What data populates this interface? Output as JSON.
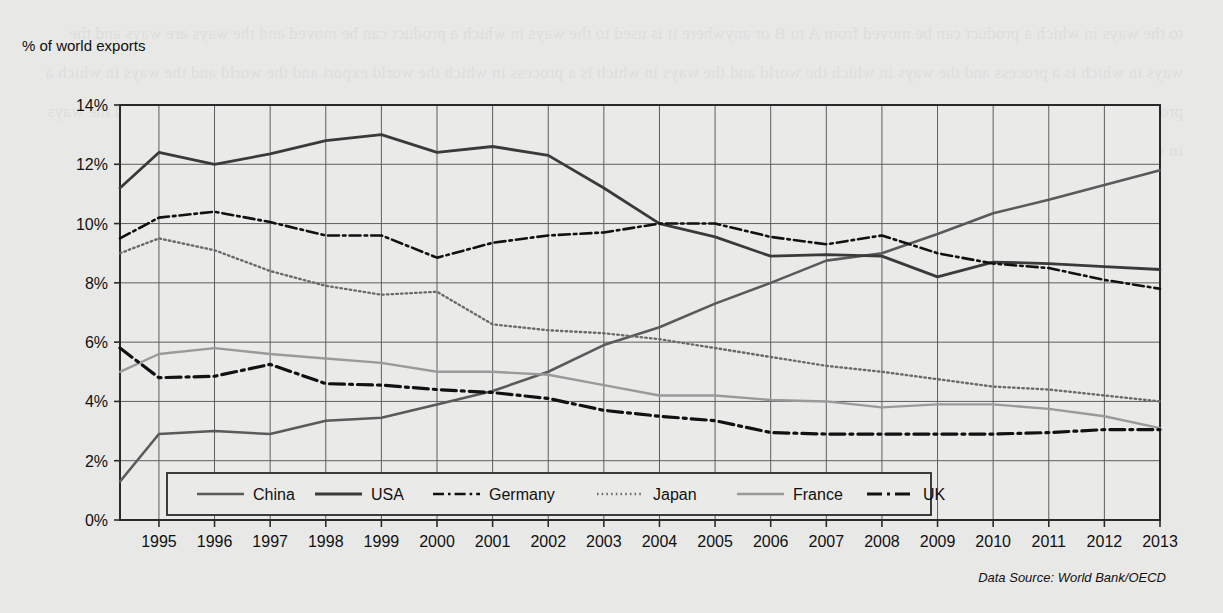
{
  "axis_title": "% of world exports",
  "source_note": "Data Source: World Bank/OECD",
  "showthrough_text": "to the ways in which a product can be moved from A to B or anywhere it is used to the ways in which a product can be moved and the ways are ways and the ways in which is a process and the ways in which the world and the ways in which is a process in which the world export and the world and the ways in which a product is and the ways and world processes and in which exports and in which the world exports and process of the world and in which a product and the ways in which the world",
  "legend": {
    "items": [
      {
        "label": "China"
      },
      {
        "label": "USA"
      },
      {
        "label": "Germany"
      },
      {
        "label": "Japan"
      },
      {
        "label": "France"
      },
      {
        "label": "UK"
      }
    ]
  },
  "chart_data": {
    "type": "line",
    "title": "",
    "xlabel": "",
    "ylabel": "% of world exports",
    "xlim": [
      1994.3,
      2013
    ],
    "ylim": [
      0,
      14
    ],
    "ytick_labels": [
      "0%",
      "2%",
      "4%",
      "6%",
      "8%",
      "10%",
      "12%",
      "14%"
    ],
    "ytick_values": [
      0,
      2,
      4,
      6,
      8,
      10,
      12,
      14
    ],
    "grid": true,
    "legend_position": "bottom-inside",
    "x": [
      1994.3,
      1995,
      1996,
      1997,
      1998,
      1999,
      2000,
      2001,
      2002,
      2003,
      2004,
      2005,
      2006,
      2007,
      2008,
      2009,
      2010,
      2011,
      2012,
      2013
    ],
    "series": [
      {
        "name": "China",
        "style": "solid",
        "color": "#5a5a5a",
        "width": 2.6,
        "values": [
          1.3,
          2.9,
          3.0,
          2.9,
          3.35,
          3.45,
          3.9,
          4.35,
          5.0,
          5.9,
          6.5,
          7.3,
          8.0,
          8.75,
          9.0,
          9.65,
          10.35,
          10.8,
          11.3,
          11.8
        ]
      },
      {
        "name": "USA",
        "style": "solid",
        "color": "#3a3a3a",
        "width": 2.8,
        "values": [
          11.2,
          12.4,
          12.0,
          12.35,
          12.8,
          13.0,
          12.4,
          12.6,
          12.3,
          11.2,
          10.0,
          9.55,
          8.9,
          8.95,
          8.9,
          8.2,
          8.7,
          8.65,
          8.55,
          8.45
        ]
      },
      {
        "name": "Germany",
        "style": "dashdot",
        "color": "#111111",
        "width": 2.6,
        "values": [
          9.5,
          10.2,
          10.4,
          10.05,
          9.6,
          9.6,
          8.85,
          9.35,
          9.6,
          9.7,
          10.0,
          10.0,
          9.55,
          9.3,
          9.6,
          9.0,
          8.65,
          8.5,
          8.1,
          7.8
        ]
      },
      {
        "name": "Japan",
        "style": "dotted",
        "color": "#6a6a6a",
        "width": 2.4,
        "values": [
          9.0,
          9.5,
          9.1,
          8.4,
          7.9,
          7.6,
          7.7,
          6.6,
          6.4,
          6.3,
          6.1,
          5.8,
          5.5,
          5.2,
          5.0,
          4.75,
          4.5,
          4.4,
          4.2,
          4.0
        ]
      },
      {
        "name": "France",
        "style": "solid",
        "color": "#9a9a9a",
        "width": 2.4,
        "values": [
          5.0,
          5.6,
          5.8,
          5.6,
          5.45,
          5.3,
          5.0,
          5.0,
          4.9,
          4.55,
          4.2,
          4.2,
          4.05,
          4.0,
          3.8,
          3.9,
          3.9,
          3.75,
          3.5,
          3.1
        ]
      },
      {
        "name": "UK",
        "style": "dashdot-bold",
        "color": "#111111",
        "width": 3.2,
        "values": [
          5.8,
          4.8,
          4.85,
          5.25,
          4.6,
          4.55,
          4.4,
          4.3,
          4.1,
          3.7,
          3.5,
          3.35,
          2.95,
          2.9,
          2.9,
          2.9,
          2.9,
          2.95,
          3.05,
          3.05
        ]
      }
    ]
  }
}
